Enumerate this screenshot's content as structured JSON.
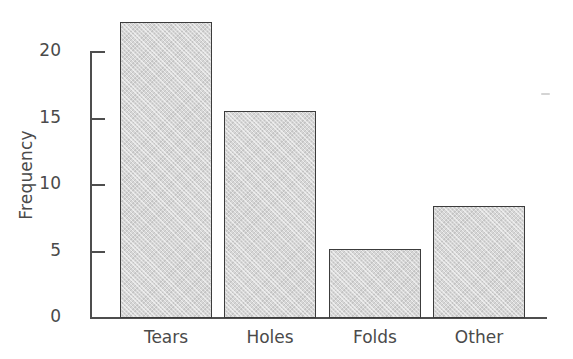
{
  "chart_data": {
    "type": "bar",
    "title": "",
    "subtitle": "",
    "xlabel": "",
    "ylabel": "Frequency",
    "categories": [
      "Tears",
      "Holes",
      "Folds",
      "Other"
    ],
    "values": [
      22,
      15,
      5,
      8
    ],
    "series": [
      {
        "name": "Frequency",
        "values": [
          22,
          15,
          5,
          8
        ]
      }
    ],
    "ylim": [
      0,
      22
    ],
    "y_ticks": [
      0,
      5,
      10,
      15,
      20
    ],
    "y_tick_labels": [
      "0",
      "5",
      "10",
      "15",
      "20"
    ],
    "grid": false,
    "legend": false,
    "legend_position": "none",
    "bar_fill_color": "#d6d6d6",
    "bar_edge_color": "#3c3c3c",
    "axis_color": "#4e4e4e",
    "text_color": "#4a4a4a",
    "background_color": "#ffffff",
    "annotations": []
  },
  "axis": {
    "y_label": "Frequency",
    "ticks": [
      {
        "value": "20",
        "y": 51
      },
      {
        "value": "15",
        "y": 118
      },
      {
        "value": "10",
        "y": 184
      },
      {
        "value": "5",
        "y": 251
      },
      {
        "value": "0",
        "y": 317
      }
    ]
  },
  "bars": [
    {
      "label": "Tears",
      "value": 22,
      "left": 120,
      "width": 92,
      "height": 296,
      "label_center": 166
    },
    {
      "label": "Holes",
      "value": 15,
      "left": 224,
      "width": 92,
      "height": 207,
      "label_center": 270
    },
    {
      "label": "Folds",
      "value": 5,
      "left": 329,
      "width": 92,
      "height": 69,
      "label_center": 375
    },
    {
      "label": "Other",
      "value": 8,
      "left": 433,
      "width": 92,
      "height": 112,
      "label_center": 479
    }
  ]
}
